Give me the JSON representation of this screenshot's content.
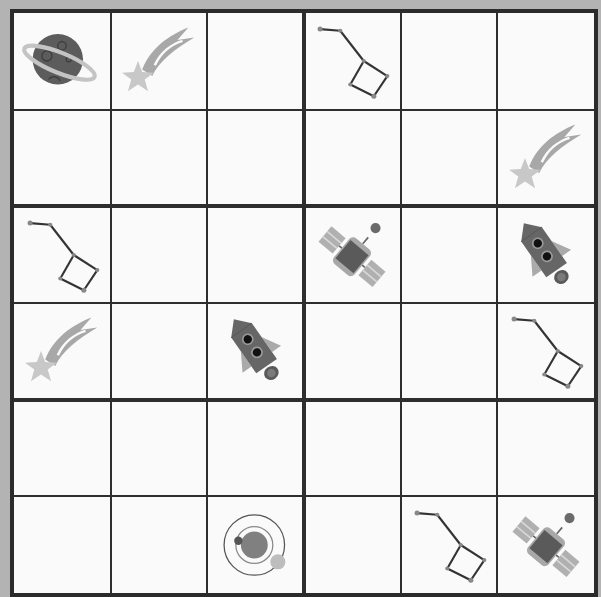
{
  "puzzle": {
    "type": "6x6 picture sudoku",
    "rows": 6,
    "cols": 6,
    "box_rows": 2,
    "box_cols": 3,
    "colors": {
      "background": "#b3b3b3",
      "board": "#fafafa",
      "grid_line": "#2e2e2e",
      "planet": "#5c5c5c",
      "ring": "#bdbdbd",
      "star_light": "#c8c8c8",
      "star_tail": "#a8a8a8",
      "constellation": "#3a3a3a",
      "satellite_body": "#5a5a5a",
      "satellite_panel": "#b0b0b0",
      "rocket_body": "#666666",
      "rocket_fin": "#aaaaaa"
    },
    "grid": [
      [
        "planet-icon",
        "shooting-star-icon",
        "",
        "constellation-icon",
        "",
        ""
      ],
      [
        "",
        "",
        "",
        "",
        "",
        "shooting-star-icon"
      ],
      [
        "constellation-icon",
        "",
        "",
        "satellite-icon",
        "",
        "rocket-icon"
      ],
      [
        "shooting-star-icon",
        "",
        "rocket-icon",
        "",
        "",
        "constellation-icon"
      ],
      [
        "",
        "",
        "",
        "",
        "",
        ""
      ],
      [
        "",
        "",
        "solar-system-icon",
        "",
        "constellation-icon",
        "satellite-icon"
      ]
    ]
  }
}
